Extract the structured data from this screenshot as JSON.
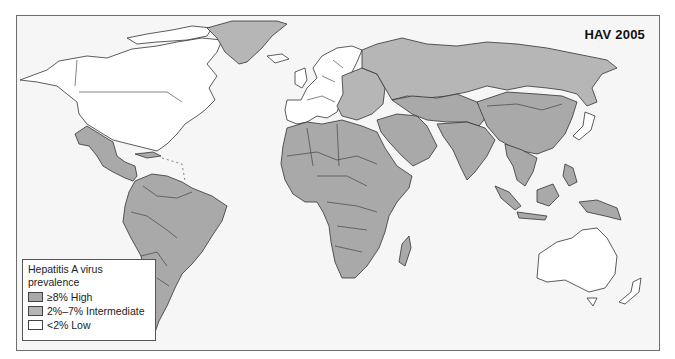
{
  "map": {
    "title": "HAV 2005",
    "colors": {
      "high": "#a9a9a9",
      "intermediate": "#b6b6b6",
      "low": "#ffffff",
      "background": "#f6f6f6",
      "border": "#333333"
    },
    "regions": [
      {
        "name": "North America (USA, Canada)",
        "category": "low"
      },
      {
        "name": "Greenland",
        "category": "intermediate"
      },
      {
        "name": "Mexico & Central America",
        "category": "high"
      },
      {
        "name": "Caribbean",
        "category": "high"
      },
      {
        "name": "South America",
        "category": "high"
      },
      {
        "name": "Western Europe",
        "category": "low"
      },
      {
        "name": "Eastern Europe",
        "category": "intermediate"
      },
      {
        "name": "Russia",
        "category": "intermediate"
      },
      {
        "name": "Africa",
        "category": "high"
      },
      {
        "name": "Middle East",
        "category": "high"
      },
      {
        "name": "Central Asia",
        "category": "high"
      },
      {
        "name": "South Asia",
        "category": "high"
      },
      {
        "name": "China",
        "category": "high"
      },
      {
        "name": "Japan",
        "category": "low"
      },
      {
        "name": "Southeast Asia",
        "category": "high"
      },
      {
        "name": "Papua New Guinea",
        "category": "high"
      },
      {
        "name": "Australia",
        "category": "low"
      },
      {
        "name": "New Zealand",
        "category": "low"
      },
      {
        "name": "Madagascar",
        "category": "high"
      }
    ]
  },
  "legend": {
    "title_line1": "Hepatitis A virus",
    "title_line2": "prevalence",
    "items": [
      {
        "label": "≥8%  High",
        "category": "high"
      },
      {
        "label": "2%–7% Intermediate",
        "category": "intermediate"
      },
      {
        "label": "<2%  Low",
        "category": "low"
      }
    ]
  }
}
